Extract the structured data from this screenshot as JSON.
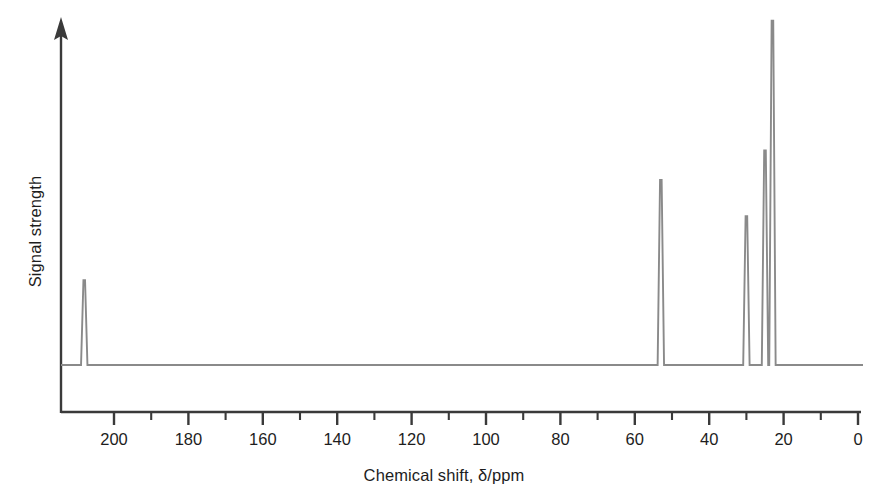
{
  "chart_data": {
    "type": "line",
    "title": "",
    "subtitle": "",
    "xlabel": "Chemical shift, δ/ppm",
    "ylabel": "Signal strength",
    "xlim": [
      210,
      -4
    ],
    "ylim": [
      0,
      1
    ],
    "x_axis_direction": "reversed",
    "grid": false,
    "legend": null,
    "annotations": [],
    "tick_labels": [
      "200",
      "180",
      "160",
      "140",
      "120",
      "100",
      "80",
      "60",
      "40",
      "20",
      "0"
    ],
    "major_ticks": [
      200,
      180,
      160,
      140,
      120,
      100,
      80,
      60,
      40,
      20,
      0
    ],
    "minor_ticks": [
      190,
      170,
      150,
      130,
      110,
      90,
      70,
      50,
      30,
      10
    ],
    "baseline_level": 0.02,
    "peaks": [
      {
        "shift_ppm": 208,
        "rel_height": 0.245,
        "label": ""
      },
      {
        "shift_ppm": 53,
        "rel_height": 0.535,
        "label": ""
      },
      {
        "shift_ppm": 30,
        "rel_height": 0.43,
        "label": ""
      },
      {
        "shift_ppm": 25,
        "rel_height": 0.62,
        "label": ""
      },
      {
        "shift_ppm": 23,
        "rel_height": 0.995,
        "label": ""
      }
    ],
    "series": [
      {
        "name": "13C NMR spectrum",
        "x": [
          208,
          53,
          30,
          25,
          23
        ],
        "values": [
          0.245,
          0.535,
          0.43,
          0.62,
          0.995
        ]
      }
    ]
  },
  "style": {
    "trace_color": "#8a8a8a",
    "axis_color": "#3a3a3a",
    "text_color": "#1d1d1d",
    "background": "#ffffff"
  }
}
